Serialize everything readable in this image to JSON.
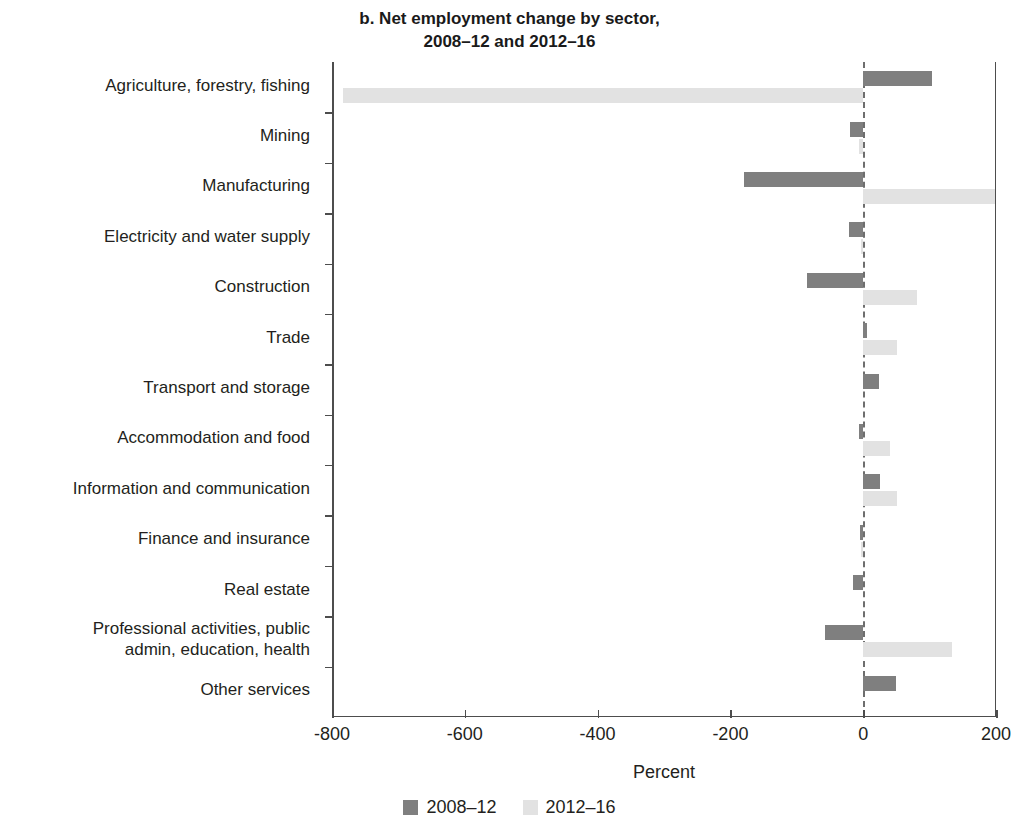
{
  "chart_data": {
    "type": "bar",
    "orientation": "horizontal",
    "title": "b. Net employment change by sector,\n2008–12 and 2012–16",
    "xlabel": "Percent",
    "ylabel": "",
    "xlim": [
      -800,
      200
    ],
    "xticks": [
      -800,
      -600,
      -400,
      -200,
      0,
      200
    ],
    "xtick_labels": [
      "-800",
      "-600",
      "-400",
      "-200",
      "0",
      "200"
    ],
    "grid": false,
    "zero_reference_line": true,
    "legend_position": "bottom",
    "categories": [
      "Agriculture, forestry, fishing",
      "Mining",
      "Manufacturing",
      "Electricity and water supply",
      "Construction",
      "Trade",
      "Transport and storage",
      "Accommodation and food",
      "Information and communication",
      "Finance and insurance",
      "Real estate",
      "Professional activities, public\nadmin, education, health",
      "Other services"
    ],
    "series": [
      {
        "name": "2008–12",
        "color": "#7f7f7f",
        "values": [
          104,
          -20,
          -179,
          -21,
          -84,
          6,
          24,
          -6,
          26,
          -5,
          -15,
          -57,
          50
        ]
      },
      {
        "name": "2012–16",
        "color": "#e2e2e2",
        "values": [
          -783,
          -7,
          199,
          -3,
          81,
          51,
          0,
          41,
          51,
          -4,
          0,
          134,
          0
        ]
      }
    ]
  },
  "legend": {
    "items": [
      {
        "label": "2008–12",
        "color": "#7f7f7f"
      },
      {
        "label": "2012–16",
        "color": "#e2e2e2"
      }
    ]
  }
}
